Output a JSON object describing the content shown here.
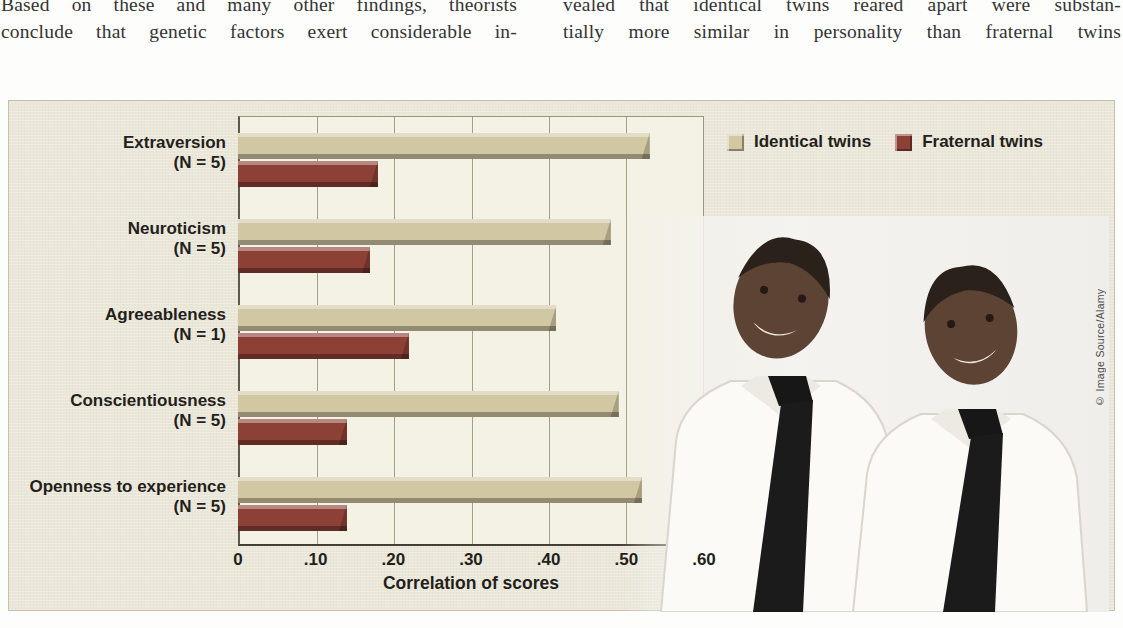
{
  "intro": {
    "left_column": [
      "Based on these and many other findings, theorists",
      "conclude that genetic factors exert considerable in-"
    ],
    "right_column": [
      "vealed that identical twins reared apart were substan-",
      "tially more similar in personality than fraternal twins"
    ]
  },
  "figure": {
    "photo_credit": "© Image Source/Alamy",
    "photo_description": "identical twin men in white shirts and black ties"
  },
  "colors": {
    "figure_background": "#eae6d8",
    "plot_background": "#f4f1e5",
    "identical_bar": "#d2c7a3",
    "fraternal_bar": "#8c4036",
    "text": "#241f1a"
  },
  "chart_data": {
    "type": "bar",
    "orientation": "horizontal",
    "title": "",
    "xlabel": "Correlation of scores",
    "ylabel": "",
    "xlim": [
      0,
      0.6
    ],
    "xticks": [
      "0",
      ".10",
      ".20",
      ".30",
      ".40",
      ".50",
      ".60"
    ],
    "grid": true,
    "legend_position": "top-right",
    "categories": [
      "Extraversion",
      "Neuroticism",
      "Agreeableness",
      "Conscientiousness",
      "Openness to experience"
    ],
    "category_sublabels": [
      "(N = 5)",
      "(N = 5)",
      "(N = 1)",
      "(N = 5)",
      "(N = 5)"
    ],
    "series": [
      {
        "name": "Identical twins",
        "color": "#d2c7a3",
        "values": [
          0.53,
          0.48,
          0.41,
          0.49,
          0.52
        ]
      },
      {
        "name": "Fraternal twins",
        "color": "#8c4036",
        "values": [
          0.18,
          0.17,
          0.22,
          0.14,
          0.14
        ]
      }
    ]
  }
}
